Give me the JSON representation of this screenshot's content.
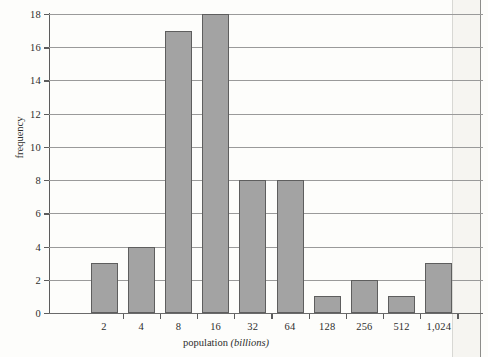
{
  "chart_data": {
    "type": "bar",
    "title": "",
    "subtitle": "",
    "xlabel": "population",
    "xlabel_unit": "(billions)",
    "ylabel": "frequency",
    "categories": [
      "2",
      "4",
      "8",
      "16",
      "32",
      "64",
      "128",
      "256",
      "512",
      "1,024"
    ],
    "values": [
      3,
      4,
      17,
      18,
      8,
      8,
      1,
      2,
      1,
      3
    ],
    "ylim": [
      0,
      18
    ],
    "ytick_step": 2,
    "yticks": [
      0,
      2,
      4,
      6,
      8,
      10,
      12,
      14,
      16,
      18
    ],
    "grid": "horizontal",
    "legend": "none",
    "bar_color": "#a3a3a3",
    "bar_edge_color": "#5e5e5e",
    "axis_color": "#5c5c5c",
    "grid_color": "#9a9a9a",
    "background_color": "#fdfdfb"
  }
}
